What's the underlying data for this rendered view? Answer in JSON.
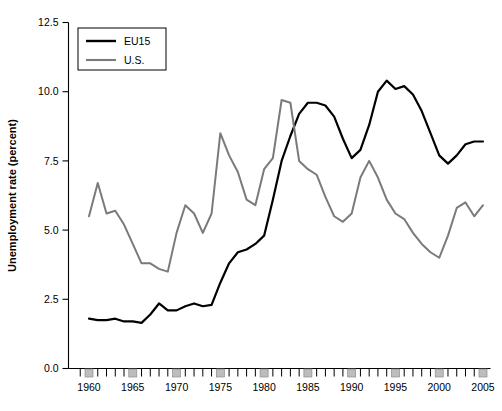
{
  "chart_data": {
    "type": "line",
    "title": "",
    "xlabel": "",
    "ylabel": "Unemployment rate (percent)",
    "ylim": [
      0.0,
      12.5
    ],
    "xlim": [
      1959,
      2006
    ],
    "yticks": [
      "0.0",
      "2.5",
      "5.0",
      "7.5",
      "10.0",
      "12.5"
    ],
    "ytick_values": [
      0.0,
      2.5,
      5.0,
      7.5,
      10.0,
      12.5
    ],
    "xticks": [
      "1960",
      "1965",
      "1970",
      "1975",
      "1980",
      "1985",
      "1990",
      "1995",
      "2000",
      "2005"
    ],
    "xtick_values": [
      1960,
      1965,
      1970,
      1975,
      1980,
      1985,
      1990,
      1995,
      2000,
      2005
    ],
    "minor_tick_interval": 1,
    "grid": false,
    "legend_position": "top-left",
    "x": [
      1960,
      1961,
      1962,
      1963,
      1964,
      1965,
      1966,
      1967,
      1968,
      1969,
      1970,
      1971,
      1972,
      1973,
      1974,
      1975,
      1976,
      1977,
      1978,
      1979,
      1980,
      1981,
      1982,
      1983,
      1984,
      1985,
      1986,
      1987,
      1988,
      1989,
      1990,
      1991,
      1992,
      1993,
      1994,
      1995,
      1996,
      1997,
      1998,
      1999,
      2000,
      2001,
      2002,
      2003,
      2004,
      2005
    ],
    "series": [
      {
        "name": "EU15",
        "color": "#000000",
        "values": [
          1.8,
          1.75,
          1.75,
          1.8,
          1.7,
          1.7,
          1.65,
          1.95,
          2.35,
          2.1,
          2.1,
          2.25,
          2.35,
          2.25,
          2.3,
          3.1,
          3.8,
          4.2,
          4.3,
          4.5,
          4.8,
          6.1,
          7.5,
          8.4,
          9.2,
          9.6,
          9.6,
          9.5,
          9.1,
          8.3,
          7.6,
          7.9,
          8.8,
          10.0,
          10.4,
          10.1,
          10.2,
          9.9,
          9.3,
          8.5,
          7.7,
          7.4,
          7.7,
          8.1,
          8.2,
          8.2
        ]
      },
      {
        "name": "U.S.",
        "color": "#7a7a7a",
        "values": [
          5.5,
          6.7,
          5.6,
          5.7,
          5.2,
          4.5,
          3.8,
          3.8,
          3.6,
          3.5,
          4.9,
          5.9,
          5.6,
          4.9,
          5.6,
          8.5,
          7.7,
          7.1,
          6.1,
          5.9,
          7.2,
          7.6,
          9.7,
          9.6,
          7.5,
          7.2,
          7.0,
          6.2,
          5.5,
          5.3,
          5.6,
          6.9,
          7.5,
          6.9,
          6.1,
          5.6,
          5.4,
          4.9,
          4.5,
          4.2,
          4.0,
          4.8,
          5.8,
          6.0,
          5.5,
          5.9
        ]
      }
    ]
  },
  "legend": {
    "items": [
      {
        "label": "EU15",
        "color": "#000000"
      },
      {
        "label": "U.S.",
        "color": "#7a7a7a"
      }
    ]
  }
}
